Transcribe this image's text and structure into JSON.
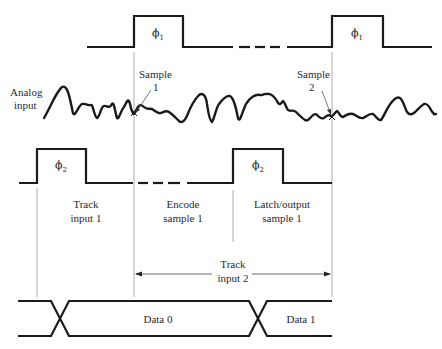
{
  "diagram": {
    "type": "timing-diagram",
    "signals": {
      "phi1": {
        "label": "ϕ",
        "subscript": "1",
        "pulses": 2
      },
      "analog": {
        "label_line1": "Analog",
        "label_line2": "input"
      },
      "phi2": {
        "label": "ϕ",
        "subscript": "2",
        "pulses": 2
      },
      "data": {
        "segments": [
          "Data 0",
          "Data 1"
        ]
      }
    },
    "annotations": {
      "sample1_line1": "Sample",
      "sample1_line2": "1",
      "sample2_line1": "Sample",
      "sample2_line2": "2",
      "track1_line1": "Track",
      "track1_line2": "input 1",
      "encode_line1": "Encode",
      "encode_line2": "sample 1",
      "latch_line1": "Latch/output",
      "latch_line2": "sample 1",
      "track2_line1": "Track",
      "track2_line2": "input 2"
    },
    "colors": {
      "waveform": "#1a1a1a",
      "guide": "#9a9a9a",
      "text": "#2a2a2a"
    }
  }
}
